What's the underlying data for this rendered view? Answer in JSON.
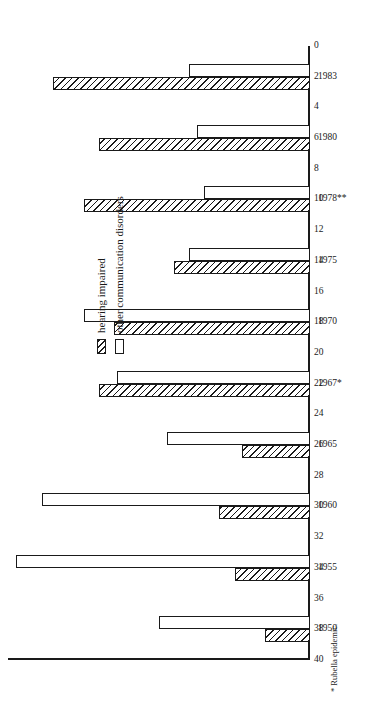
{
  "chart_data": {
    "type": "bar",
    "title": "",
    "xlabel": "",
    "ylabel": "",
    "orientation": "horizontal-rotated-page",
    "grid": false,
    "legend_position": "inside-left",
    "ylim": [
      0,
      40
    ],
    "tick_step": 2,
    "tick_labels": [
      "40",
      "38",
      "36",
      "34",
      "32",
      "30",
      "28",
      "26",
      "24",
      "22",
      "20",
      "18",
      "16",
      "14",
      "12",
      "10",
      "8",
      "6",
      "4",
      "2",
      "0"
    ],
    "categories": [
      "1950",
      "1955",
      "1960",
      "1965",
      "1967*",
      "1970",
      "1975",
      "1978**",
      "1980",
      "1983"
    ],
    "series": [
      {
        "name": "hearing impaired",
        "pattern": "hatched",
        "values": [
          6,
          10,
          12,
          9,
          28,
          26,
          18,
          30,
          28,
          34
        ]
      },
      {
        "name": "other communication disorders",
        "pattern": "open",
        "values": [
          20,
          39,
          35.5,
          19,
          25.5,
          30,
          16,
          14,
          15,
          16
        ]
      }
    ],
    "annotations": [
      "* Rubella epidemic."
    ]
  },
  "legend": {
    "items": [
      {
        "label": "hearing impaired",
        "pattern": "hatched"
      },
      {
        "label": "other communication disorders",
        "pattern": "open"
      }
    ]
  },
  "footnotes": [
    "* Rubella epidemic."
  ],
  "colors": {
    "ink": "#1a1a1a",
    "paper": "#ffffff"
  }
}
